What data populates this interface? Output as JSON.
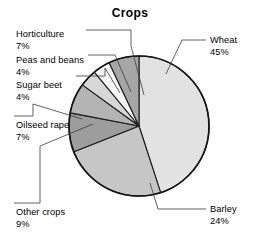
{
  "chart_data": {
    "type": "pie",
    "title": "Crops",
    "xlabel": "",
    "ylabel": "",
    "legend_position": "none",
    "grid": false,
    "units": "percent",
    "start_angle_deg": 0,
    "direction": "clockwise",
    "categories": [
      "Wheat",
      "Barley",
      "Other crops",
      "Oilseed rape",
      "Sugar beet",
      "Peas and beans",
      "Horticulture"
    ],
    "values": [
      45,
      24,
      9,
      7,
      4,
      4,
      7
    ],
    "slices": [
      {
        "name": "Wheat",
        "value": 45,
        "value_label": "45%",
        "color": "#e2e2e2",
        "label_x": 210,
        "label_y": 43,
        "label_anchor": "start"
      },
      {
        "name": "Barley",
        "value": 24,
        "value_label": "24%",
        "color": "#c6c6c6",
        "label_x": 210,
        "label_y": 212,
        "label_anchor": "start"
      },
      {
        "name": "Other crops",
        "value": 9,
        "value_label": "9%",
        "color": "#9d9d9d",
        "label_x": 16,
        "label_y": 215,
        "label_anchor": "start"
      },
      {
        "name": "Oilseed rape",
        "value": 7,
        "value_label": "7%",
        "color": "#b4b4b4",
        "label_x": 16,
        "label_y": 128,
        "label_anchor": "start"
      },
      {
        "name": "Sugar beet",
        "value": 4,
        "value_label": "4%",
        "color": "#d7d7d7",
        "label_x": 16,
        "label_y": 88,
        "label_anchor": "start"
      },
      {
        "name": "Peas and beans",
        "value": 4,
        "value_label": "4%",
        "color": "#f6f6f6",
        "label_x": 16,
        "label_y": 63,
        "label_anchor": "start"
      },
      {
        "name": "Horticulture",
        "value": 7,
        "value_label": "7%",
        "color": "#a6a6a6",
        "label_x": 16,
        "label_y": 37,
        "label_anchor": "start"
      }
    ]
  },
  "geometry": {
    "center_x": 139,
    "center_y": 126,
    "radius": 70,
    "title_x": 130,
    "title_y": 17
  },
  "leaders": {
    "wheat": "M 206,40 L 182,40 L 166,74",
    "barley": "M 206,209 L 158,209 L 150,183",
    "other_crops": "M 14,203 L 40,203 L 40,146 L 93,124",
    "oilseed_rape": "M 14,116 L 33,116 L 33,104 L 82,119",
    "sugar_beet": "M 76,76 L 105,76 L 105,68 L 120,93",
    "peas_and_beans": "M 88,55 L 115,55 L 131,92",
    "horticulture": "M 86,30 L 131,30 L 131,46 L 144,95"
  },
  "colors": {
    "background": "#ffffff",
    "text": "#111111",
    "outline": "#141414",
    "leader": "#3a3a3a"
  }
}
